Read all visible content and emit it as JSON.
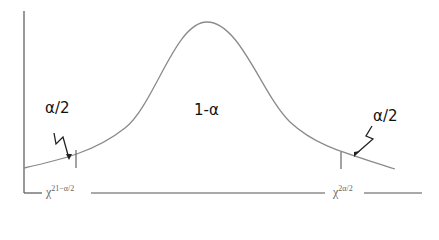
{
  "diagram": {
    "labels": {
      "left_tail": "α/2",
      "center": "1-α",
      "right_tail": "α/2",
      "left_critical_base": "χ",
      "left_critical_sup": "2",
      "left_critical_sub": "1−α/2",
      "right_critical_base": "χ",
      "right_critical_sup": "2",
      "right_critical_sub": "α/2"
    },
    "colors": {
      "curve": "#8a8a8a",
      "axis": "#555555",
      "arrow": "#222222",
      "text": "#111111"
    }
  }
}
